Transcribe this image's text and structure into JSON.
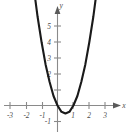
{
  "figure": {
    "background_color": "#ffffff",
    "axis_color": "#8a8a8a",
    "curve_color": "#1a1a1a",
    "label_color": "#4a4a4a",
    "x_axis_name": "x",
    "y_axis_name": "y"
  },
  "chart_data": {
    "type": "line",
    "title": "",
    "xlabel": "x",
    "ylabel": "y",
    "xlim": [
      -3.6,
      3.9
    ],
    "ylim": [
      -1.6,
      6.0
    ],
    "grid": false,
    "legend": null,
    "x_ticks": [
      -3,
      -2,
      -1,
      1,
      2,
      3
    ],
    "x_tick_labels": [
      "-3",
      "-2",
      "-1",
      "1",
      "2",
      "3"
    ],
    "y_ticks": [
      -1,
      1,
      2,
      3,
      4,
      5
    ],
    "y_tick_labels": [
      "-1",
      "",
      "2",
      "3",
      "4",
      "5"
    ],
    "y_tick_labels_visible": [
      "-1",
      "2",
      "3",
      "4",
      "5"
    ],
    "series": [
      {
        "name": "parabola",
        "equation": "y = 2x^2 - 2x",
        "vertex": [
          0.5,
          -0.5
        ],
        "roots": [
          0,
          1
        ],
        "x": [
          -1.95,
          -1.75,
          -1.5,
          -1.25,
          -1.0,
          -0.75,
          -0.5,
          -0.25,
          0.0,
          0.25,
          0.5,
          0.75,
          1.0,
          1.25,
          1.5,
          1.75,
          2.0,
          2.25,
          2.5,
          2.75,
          2.95
        ],
        "values": [
          11.5,
          9.6,
          7.5,
          5.6,
          4.0,
          2.6,
          1.5,
          0.6,
          0.0,
          -0.4,
          -0.5,
          -0.4,
          0.0,
          0.6,
          1.5,
          2.6,
          4.0,
          5.6,
          7.5,
          9.6,
          11.5
        ]
      }
    ]
  },
  "x_tick_items": [
    {
      "label": "-3"
    },
    {
      "label": "-2"
    },
    {
      "label": "-1"
    },
    {
      "label": "1"
    },
    {
      "label": "2"
    },
    {
      "label": "3"
    }
  ],
  "y_tick_items": [
    {
      "label": "5"
    },
    {
      "label": "4"
    },
    {
      "label": "3"
    },
    {
      "label": "2"
    },
    {
      "label": "-1"
    }
  ]
}
